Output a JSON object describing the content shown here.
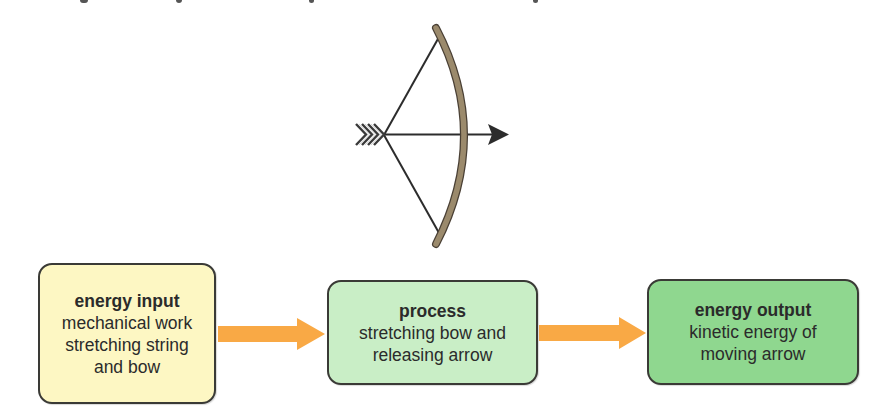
{
  "diagram": {
    "illustration": {
      "subject": "bow-and-arrow",
      "bow_color": "#9b8a6c",
      "string_color": "#2c2c2c",
      "arrow_color": "#2c2c2c"
    },
    "flow": [
      {
        "title": "energy input",
        "lines": [
          "mechanical work",
          "stretching string",
          "and bow"
        ],
        "fill": "#fdf7c3"
      },
      {
        "title": "process",
        "lines": [
          "stretching bow and",
          "releasing arrow"
        ],
        "fill": "#c9eec6"
      },
      {
        "title": "energy output",
        "lines": [
          "kinetic energy of",
          "moving arrow"
        ],
        "fill": "#8fd78f"
      }
    ],
    "connector_color": "#f9a945"
  }
}
